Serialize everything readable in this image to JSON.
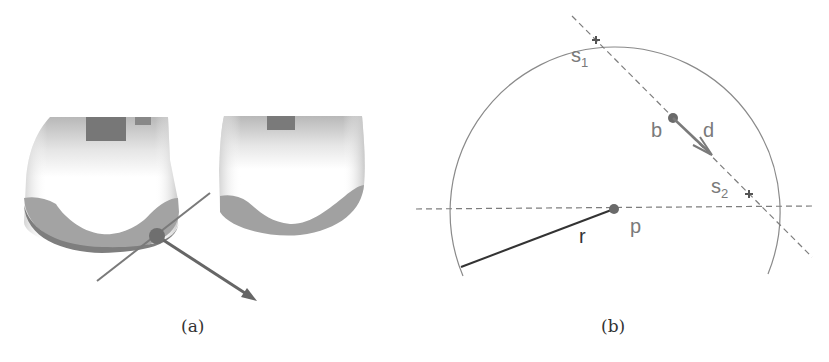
{
  "figure": {
    "panels": [
      {
        "id": "a",
        "caption": "(a)",
        "description": "Two rendered 3D bone-end (condyle) shapes; a contact point sphere on the left shape with a tangent line and a normal/direction arrow"
      },
      {
        "id": "b",
        "caption": "(b)",
        "labels": {
          "s1": "s",
          "s1_sub": "1",
          "s2": "s",
          "s2_sub": "2",
          "b": "b",
          "d": "d",
          "p": "p",
          "r": "r"
        }
      }
    ]
  },
  "colors": {
    "background": "#ffffff",
    "line": "#7d7d7d",
    "dark_line": "#333333",
    "point": "#666666",
    "shape_light": "#f2f2f2",
    "shape_shadow": "#a7a7a7",
    "shape_band": "#8e8e8e",
    "label": "#7a7a7a"
  }
}
